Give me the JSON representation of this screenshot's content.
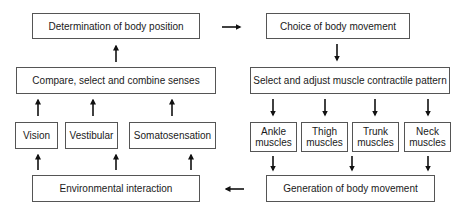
{
  "diagram": {
    "left_column": {
      "determination": "Determination of body position",
      "compare": "Compare, select and combine senses",
      "senses": [
        "Vision",
        "Vestibular",
        "Somatosensation"
      ],
      "environment": "Environmental interaction"
    },
    "right_column": {
      "choice": "Choice of body movement",
      "select_adjust": "Select and adjust muscle contractile pattern",
      "muscles": [
        {
          "line1": "Ankle",
          "line2": "muscles"
        },
        {
          "line1": "Thigh",
          "line2": "muscles"
        },
        {
          "line1": "Trunk",
          "line2": "muscles"
        },
        {
          "line1": "Neck",
          "line2": "muscles"
        }
      ],
      "generation": "Generation of body movement"
    },
    "colors": {
      "stroke": "#555555",
      "arrow": "#111111",
      "text": "#1a1a1a"
    }
  }
}
